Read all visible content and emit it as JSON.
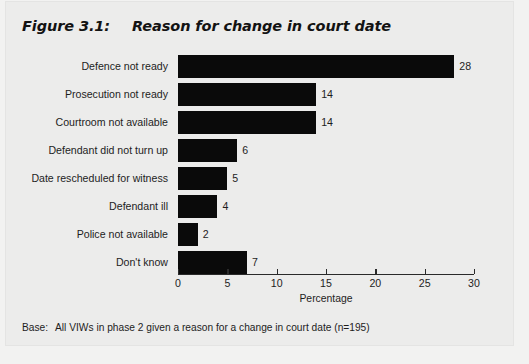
{
  "figure": {
    "number": "Figure 3.1:",
    "title": "Reason for change in court date",
    "footnote_label": "Base:",
    "footnote_text": "All VIWs in phase 2 given a reason for a change in court date (n=195)"
  },
  "colors": {
    "bar": "#0a0a0a",
    "axis": "#2a2a2a",
    "text": "#1d1d1d",
    "background": "#ececeb"
  },
  "chart_data": {
    "type": "bar",
    "orientation": "horizontal",
    "title": "Reason for change in court date",
    "xlabel": "Percentage",
    "ylabel": "",
    "xlim": [
      0,
      30
    ],
    "xticks": [
      0,
      5,
      10,
      15,
      20,
      25,
      30
    ],
    "xtick_labels": [
      "0",
      "5",
      "10",
      "15",
      "20",
      "25",
      "30"
    ],
    "grid": false,
    "legend": false,
    "categories": [
      "Defence not ready",
      "Prosecution not ready",
      "Courtroom not available",
      "Defendant did not turn up",
      "Date rescheduled for witness",
      "Defendant ill",
      "Police not available",
      "Don't know"
    ],
    "values": [
      28,
      14,
      14,
      6,
      5,
      4,
      2,
      7
    ],
    "value_labels": [
      "28",
      "14",
      "14",
      "6",
      "5",
      "4",
      "2",
      "7"
    ]
  }
}
